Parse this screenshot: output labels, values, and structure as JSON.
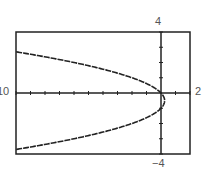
{
  "chart_data": {
    "type": "line",
    "title": "",
    "xlabel": "",
    "ylabel": "",
    "equation": "x = -y^2 - y",
    "xlim": [
      -10,
      2
    ],
    "ylim": [
      -4,
      4
    ],
    "xscale": 1,
    "yscale": 1,
    "grid": false,
    "window_labels": {
      "xmin": "10",
      "xmax": "2",
      "ymax": "4",
      "ymin": "−4"
    },
    "series": [
      {
        "name": "curve",
        "points": [
          [
            -10,
            2.7
          ],
          [
            -8,
            2.37
          ],
          [
            -6,
            1.96
          ],
          [
            -4,
            1.56
          ],
          [
            -2,
            1.0
          ],
          [
            0,
            0
          ],
          [
            0.25,
            -0.5
          ],
          [
            0,
            -1
          ],
          [
            -2,
            -2.0
          ],
          [
            -4,
            -2.56
          ],
          [
            -6,
            -2.96
          ],
          [
            -8,
            -3.37
          ],
          [
            -10,
            -3.7
          ]
        ]
      }
    ]
  },
  "colors": {
    "frame": "#222222",
    "curve": "#222222",
    "labels": "#555555"
  }
}
